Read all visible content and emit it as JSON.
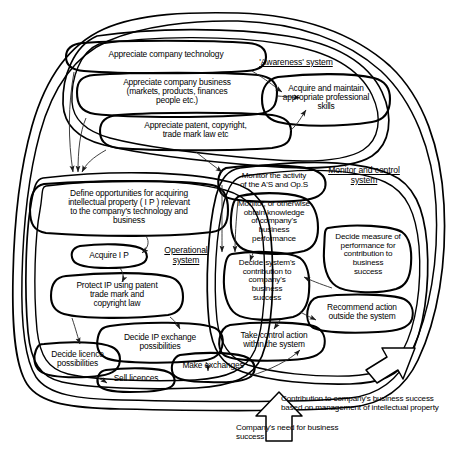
{
  "diagram": {
    "style": {
      "stroke": "#000000",
      "background": "#ffffff",
      "thin_stroke": "#3a3a3a"
    },
    "system_labels": [
      {
        "id": "awareness",
        "text": "'Awareness' system"
      },
      {
        "id": "monitor",
        "text": "Monitor and control\nsystem"
      },
      {
        "id": "operational",
        "text": "Operational\nsystem"
      }
    ],
    "nodes": [
      {
        "id": "appreciate-technology",
        "text": "Appreciate company technology"
      },
      {
        "id": "appreciate-business",
        "text": "Appreciate company business\n(markets, products, finances\npeople etc.)"
      },
      {
        "id": "appreciate-patent",
        "text": "Appreciate patent, copyright,\ntrade mark law etc"
      },
      {
        "id": "acquire-skills",
        "text": "Acquire and maintain\nappropriate professional\nskills"
      },
      {
        "id": "define-opportunities",
        "text": "Define opportunities for acquiring\nintellectual property ( I P ) relevant\nto the company's technology and\nbusiness"
      },
      {
        "id": "acquire-ip",
        "text": "Acquire I P"
      },
      {
        "id": "protect-ip",
        "text": "Protect IP using patent\ntrade mark and\ncopyright law"
      },
      {
        "id": "decide-ip-exchange",
        "text": "Decide IP exchange\npossibilities"
      },
      {
        "id": "decide-licence",
        "text": "Decide licence\npossibilities"
      },
      {
        "id": "sell-licences",
        "text": "Sell licences"
      },
      {
        "id": "make-exchanges",
        "text": "Make exchanges"
      },
      {
        "id": "monitor-activity",
        "text": "Monitor the activity\nof the A'S and Op.S"
      },
      {
        "id": "monitor-knowledge",
        "text": "Monitor, or otherwise\nobtain knowledge\nof company's\nbusiness\nperformance"
      },
      {
        "id": "decide-contribution",
        "text": "Decide system's\ncontribution to\ncompany's\nbusiness\nsuccess"
      },
      {
        "id": "decide-measure",
        "text": "Decide measure of\nperformance for\ncontribution to\nbusiness\nsuccess"
      },
      {
        "id": "recommend-action",
        "text": "Recommend action\noutside the system"
      },
      {
        "id": "take-control",
        "text": "Take control action\nwithin the system"
      }
    ],
    "captions": [
      {
        "id": "output-caption",
        "text": "Contribution to company's\nbusiness success based on\nmanagement of intellectual\nproperty"
      },
      {
        "id": "input-caption",
        "text": "Company's need\nfor business success"
      }
    ]
  }
}
